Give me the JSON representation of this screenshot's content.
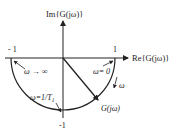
{
  "diagram": {
    "type": "nyquist-plot",
    "axes": {
      "imag_label": "Im{G(jω)}",
      "real_label": "Re{G(jω)}"
    },
    "ticks": {
      "left": "- 1",
      "right": "1",
      "bottom": "-1"
    },
    "annotations": {
      "omega_infinity": "ω → ∞",
      "omega_zero": "ω= 0",
      "omega_corner": "ω=1/T",
      "omega_corner_sub": "1",
      "omega_direction": "ω",
      "vector_label": "G(jω)"
    },
    "colors": {
      "stroke": "#222222",
      "background": "#ffffff"
    }
  }
}
